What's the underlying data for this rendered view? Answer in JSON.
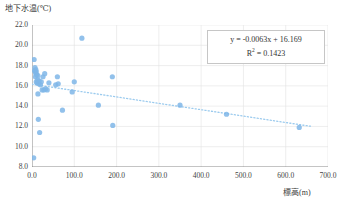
{
  "chart_data": {
    "type": "scatter",
    "title": "",
    "xlabel": "標高(m)",
    "ylabel": "地下水温(℃)",
    "xlim": [
      0,
      700
    ],
    "ylim": [
      8,
      22
    ],
    "xticks": [
      0,
      100,
      200,
      300,
      400,
      500,
      600,
      700
    ],
    "yticks": [
      8,
      10,
      12,
      14,
      16,
      18,
      20,
      22
    ],
    "xtick_labels": [
      "0.0",
      "100.0",
      "200.0",
      "300.0",
      "400.0",
      "500.0",
      "600.0",
      "700.0"
    ],
    "ytick_labels": [
      "8.0",
      "10.0",
      "12.0",
      "14.0",
      "16.0",
      "18.0",
      "20.0",
      "22.0"
    ],
    "grid": true,
    "legend": false,
    "marker_color": "#7FB6E8",
    "trendline_color": "#9CCBEE",
    "grid_color": "#E2E2E2",
    "axis_color": "#7a7a7a",
    "series": [
      {
        "name": "地下水温",
        "points": [
          [
            4,
            8.9
          ],
          [
            5,
            18.6
          ],
          [
            6,
            17.5
          ],
          [
            7,
            17.8
          ],
          [
            8,
            17.3
          ],
          [
            8,
            16.9
          ],
          [
            9,
            17.6
          ],
          [
            10,
            17.4
          ],
          [
            10,
            16.4
          ],
          [
            11,
            17.1
          ],
          [
            12,
            16.3
          ],
          [
            13,
            16.6
          ],
          [
            14,
            17.0
          ],
          [
            14,
            15.2
          ],
          [
            15,
            12.7
          ],
          [
            16,
            16.2
          ],
          [
            17,
            16.5
          ],
          [
            18,
            11.4
          ],
          [
            20,
            16.1
          ],
          [
            22,
            16.4
          ],
          [
            24,
            15.6
          ],
          [
            26,
            16.9
          ],
          [
            28,
            15.6
          ],
          [
            30,
            17.2
          ],
          [
            32,
            15.7
          ],
          [
            36,
            15.6
          ],
          [
            40,
            16.3
          ],
          [
            56,
            16.1
          ],
          [
            60,
            16.9
          ],
          [
            62,
            16.2
          ],
          [
            72,
            13.6
          ],
          [
            95,
            15.4
          ],
          [
            100,
            16.4
          ],
          [
            118,
            20.7
          ],
          [
            157,
            14.1
          ],
          [
            190,
            16.9
          ],
          [
            191,
            12.1
          ],
          [
            350,
            14.1
          ],
          [
            460,
            13.2
          ],
          [
            632,
            11.9
          ]
        ]
      }
    ],
    "trendline": {
      "slope": -0.0063,
      "intercept": 16.169,
      "r_squared": 0.1423,
      "style": "dotted"
    },
    "annotations": {
      "equation": "y = -0.0063x + 16.169",
      "r_squared_prefix": "R",
      "r_squared_exponent": "2",
      "r_squared_value": " = 0.1423"
    }
  }
}
